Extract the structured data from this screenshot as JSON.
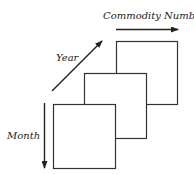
{
  "diagram": {
    "axes": {
      "commodity": {
        "label": "Commodity Number",
        "direction": "right"
      },
      "year": {
        "label": "Year",
        "direction": "diagonal-up-right"
      },
      "month": {
        "label": "Month",
        "direction": "down"
      }
    },
    "layers": [
      {
        "name": "back",
        "x": 116,
        "y": 41,
        "width": 61,
        "height": 63
      },
      {
        "name": "middle",
        "x": 84,
        "y": 73,
        "width": 62,
        "height": 65
      },
      {
        "name": "front",
        "x": 53,
        "y": 104,
        "width": 62,
        "height": 64
      }
    ],
    "colors": {
      "stroke": "#333333",
      "fill": "#ffffff",
      "text": "#222222"
    }
  }
}
